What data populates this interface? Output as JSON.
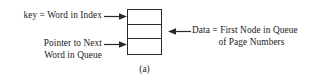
{
  "figure": {
    "caption": "(a)",
    "box": {
      "cells": [
        {
          "name": "key-cell",
          "value": ""
        },
        {
          "name": "data-cell",
          "value": ""
        },
        {
          "name": "pointer-cell",
          "value": ""
        }
      ]
    },
    "annotations": {
      "key_label": "key = Word in Index",
      "pointer_label_line1": "Pointer to Next",
      "pointer_label_line2": "Word in Queue",
      "data_label_line1": "Data = First Node in Queue",
      "data_label_line2": "of Page Numbers"
    },
    "arrows": [
      {
        "name": "arrow-key-to-box",
        "direction": "right"
      },
      {
        "name": "arrow-pointer-to-box",
        "direction": "right"
      },
      {
        "name": "arrow-data-to-box",
        "direction": "left"
      }
    ],
    "colors": {
      "stroke": "#2b2b2b",
      "text": "#1a1a1a",
      "background": "#ffffff"
    }
  }
}
